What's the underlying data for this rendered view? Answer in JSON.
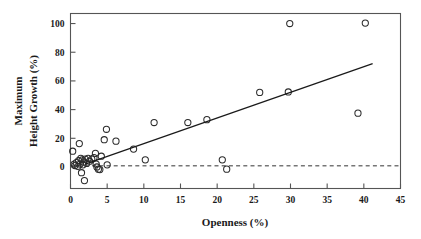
{
  "chart_data": {
    "type": "scatter",
    "title": "",
    "xlabel": "Openness (%)",
    "ylabel_line1": "Maximum",
    "ylabel_line2": "Height Growth (%)",
    "xlim": [
      0,
      45
    ],
    "ylim": [
      -15,
      107
    ],
    "xticks": [
      0,
      5,
      10,
      15,
      20,
      25,
      30,
      35,
      40,
      45
    ],
    "xtick_labels": [
      "0",
      "5",
      "10",
      "15",
      "20",
      "25",
      "30",
      "35",
      "40",
      "45"
    ],
    "yticks": [
      0,
      20,
      40,
      60,
      80,
      100
    ],
    "ytick_labels": [
      "0",
      "20",
      "40",
      "60",
      "80",
      "100"
    ],
    "grid": false,
    "legend": "none",
    "marker": "open-circle",
    "marker_color": "#2b2b2b",
    "points": [
      {
        "x": 0.3,
        "y": 11.0
      },
      {
        "x": 0.5,
        "y": 2.0
      },
      {
        "x": 0.6,
        "y": 1.0
      },
      {
        "x": 0.8,
        "y": 3.0
      },
      {
        "x": 1.0,
        "y": 0.5
      },
      {
        "x": 1.1,
        "y": 4.5
      },
      {
        "x": 1.2,
        "y": 16.3
      },
      {
        "x": 1.3,
        "y": 2.0
      },
      {
        "x": 1.4,
        "y": 6.0
      },
      {
        "x": 1.5,
        "y": -4.0
      },
      {
        "x": 1.6,
        "y": 5.0
      },
      {
        "x": 1.7,
        "y": 1.5
      },
      {
        "x": 1.8,
        "y": 3.5
      },
      {
        "x": 1.9,
        "y": -9.5
      },
      {
        "x": 2.0,
        "y": 5.5
      },
      {
        "x": 2.2,
        "y": 2.5
      },
      {
        "x": 2.4,
        "y": 6.0
      },
      {
        "x": 2.6,
        "y": 4.0
      },
      {
        "x": 2.9,
        "y": 5.5
      },
      {
        "x": 3.2,
        "y": 6.5
      },
      {
        "x": 3.4,
        "y": 9.5
      },
      {
        "x": 3.5,
        "y": 2.0
      },
      {
        "x": 3.6,
        "y": 0.0
      },
      {
        "x": 3.8,
        "y": -1.5
      },
      {
        "x": 4.0,
        "y": -1.8
      },
      {
        "x": 4.2,
        "y": 7.5
      },
      {
        "x": 4.6,
        "y": 19.0
      },
      {
        "x": 4.9,
        "y": 26.3
      },
      {
        "x": 5.0,
        "y": 1.5
      },
      {
        "x": 6.2,
        "y": 18.0
      },
      {
        "x": 8.6,
        "y": 12.5
      },
      {
        "x": 10.2,
        "y": 5.0
      },
      {
        "x": 11.4,
        "y": 31.0
      },
      {
        "x": 16.0,
        "y": 31.0
      },
      {
        "x": 18.6,
        "y": 33.0
      },
      {
        "x": 20.7,
        "y": 5.0
      },
      {
        "x": 21.3,
        "y": -1.5
      },
      {
        "x": 25.8,
        "y": 52.0
      },
      {
        "x": 29.7,
        "y": 52.3
      },
      {
        "x": 29.9,
        "y": 100.0
      },
      {
        "x": 39.2,
        "y": 37.5
      },
      {
        "x": 40.2,
        "y": 100.3
      }
    ],
    "regression_line": {
      "x_start": 2.0,
      "y_start": 2.0,
      "x_end": 41.2,
      "y_end": 72.0,
      "style": "solid"
    },
    "reference_line": {
      "y": 0.8,
      "x_start": 0,
      "x_end": 45,
      "style": "dashed"
    }
  }
}
